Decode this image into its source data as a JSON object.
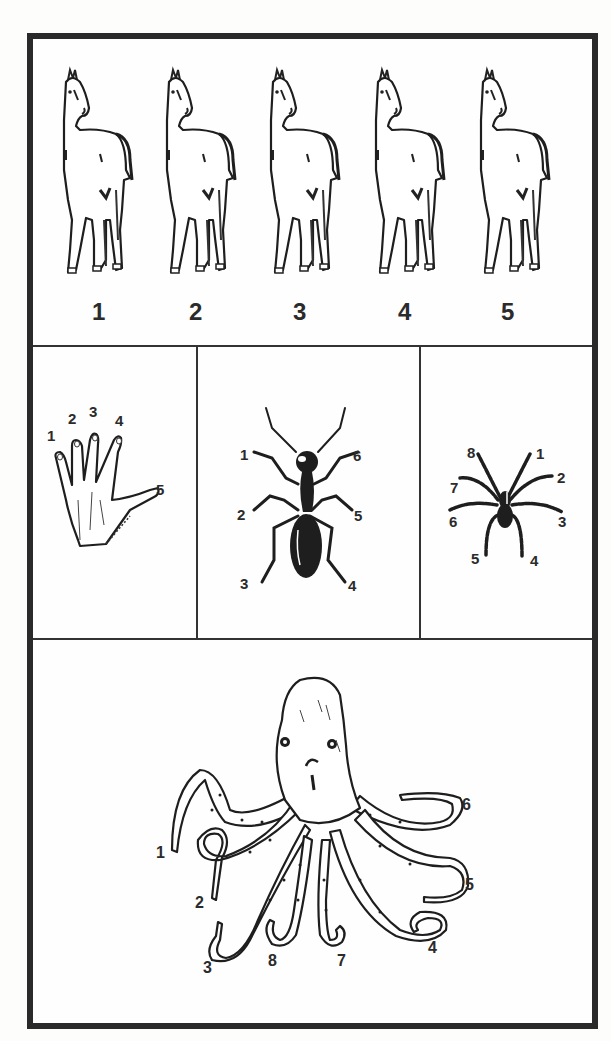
{
  "figure": {
    "border_color": "#2a2a2a",
    "panels": {
      "horses": {
        "labels": [
          "1",
          "2",
          "3",
          "4",
          "5"
        ],
        "label_x": [
          99,
          196,
          300,
          405,
          508
        ]
      },
      "hand": {
        "labels": [
          {
            "text": "1",
            "x": 47,
            "y": 428
          },
          {
            "text": "2",
            "x": 68,
            "y": 411
          },
          {
            "text": "3",
            "x": 89,
            "y": 404
          },
          {
            "text": "4",
            "x": 115,
            "y": 413
          },
          {
            "text": "5",
            "x": 156,
            "y": 482
          }
        ]
      },
      "ant": {
        "labels": [
          {
            "text": "1",
            "x": 240,
            "y": 447
          },
          {
            "text": "6",
            "x": 353,
            "y": 448
          },
          {
            "text": "2",
            "x": 237,
            "y": 507
          },
          {
            "text": "5",
            "x": 354,
            "y": 508
          },
          {
            "text": "3",
            "x": 240,
            "y": 576
          },
          {
            "text": "4",
            "x": 348,
            "y": 578
          }
        ]
      },
      "spider": {
        "labels": [
          {
            "text": "8",
            "x": 467,
            "y": 445
          },
          {
            "text": "1",
            "x": 536,
            "y": 446
          },
          {
            "text": "7",
            "x": 450,
            "y": 480
          },
          {
            "text": "2",
            "x": 557,
            "y": 470
          },
          {
            "text": "6",
            "x": 449,
            "y": 514
          },
          {
            "text": "3",
            "x": 558,
            "y": 514
          },
          {
            "text": "5",
            "x": 471,
            "y": 551
          },
          {
            "text": "4",
            "x": 530,
            "y": 553
          }
        ]
      },
      "octopus": {
        "labels": [
          {
            "text": "1",
            "x": 156,
            "y": 845
          },
          {
            "text": "2",
            "x": 195,
            "y": 895
          },
          {
            "text": "3",
            "x": 203,
            "y": 960
          },
          {
            "text": "8",
            "x": 268,
            "y": 953
          },
          {
            "text": "7",
            "x": 337,
            "y": 953
          },
          {
            "text": "4",
            "x": 428,
            "y": 940
          },
          {
            "text": "5",
            "x": 465,
            "y": 877
          },
          {
            "text": "6",
            "x": 462,
            "y": 797
          }
        ]
      }
    }
  }
}
